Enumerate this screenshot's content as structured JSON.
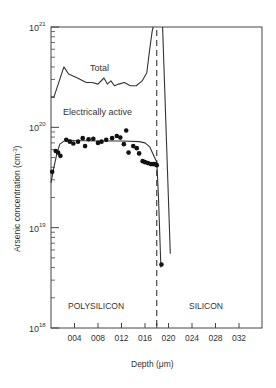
{
  "chart_data": {
    "type": "line",
    "title": "",
    "xlabel": "Depth (μm)",
    "ylabel": "Arsenic concentration (cm⁻³)",
    "xlim": [
      0,
      0.36
    ],
    "ylim": [
      1e+18,
      1e+21
    ],
    "yscale": "log",
    "x_ticks": [
      "004",
      "008",
      "012",
      "016",
      "020",
      "024",
      "028",
      "032"
    ],
    "x_tick_values": [
      0.04,
      0.08,
      0.12,
      0.16,
      0.2,
      0.24,
      0.28,
      0.32
    ],
    "y_ticks": [
      {
        "base": "10",
        "exp": "18",
        "value": 1e+18
      },
      {
        "base": "10",
        "exp": "19",
        "value": 1e+19
      },
      {
        "base": "10",
        "exp": "20",
        "value": 1e+20
      },
      {
        "base": "10",
        "exp": "21",
        "value": 1e+21
      }
    ],
    "grid": false,
    "interface_depth": 0.18,
    "regions": [
      {
        "label": "POLYSILICON",
        "x_center": 0.09
      },
      {
        "label": "SILICON",
        "x_center": 0.265
      }
    ],
    "series": [
      {
        "name": "Total",
        "style": "line",
        "label": "Total",
        "x": [
          0.0,
          0.005,
          0.022,
          0.03,
          0.045,
          0.06,
          0.07,
          0.08,
          0.09,
          0.096,
          0.102,
          0.108,
          0.115,
          0.125,
          0.135,
          0.145,
          0.155,
          0.163,
          0.168,
          0.172,
          0.174
        ],
        "y": [
          2e+20,
          2e+20,
          4e+20,
          3.4e+20,
          3.1e+20,
          2.8e+20,
          2.8e+20,
          2.7e+20,
          3.1e+20,
          2.7e+20,
          2.9e+20,
          2.6e+20,
          2.7e+20,
          2.8e+20,
          2.6e+20,
          2.6e+20,
          2.9e+20,
          3.5e+20,
          6e+20,
          9e+20,
          1e+21
        ]
      },
      {
        "name": "Total (silicon tail)",
        "style": "line",
        "x": [
          0.19,
          0.203
        ],
        "y": [
          1e+21,
          5.5e+18
        ]
      },
      {
        "name": "Electrically active (fit)",
        "style": "line",
        "label": "Electrically active",
        "x": [
          0.0,
          0.005,
          0.01,
          0.015,
          0.025,
          0.04,
          0.08,
          0.12,
          0.15,
          0.16,
          0.168,
          0.175,
          0.18,
          0.183,
          0.187
        ],
        "y": [
          2.8e+19,
          4e+19,
          5.5e+19,
          6.8e+19,
          7.5e+19,
          7.4e+19,
          7.3e+19,
          7.3e+19,
          7.2e+19,
          7e+19,
          6.4e+19,
          5.2e+19,
          4.5e+19,
          2e+19,
          4e+18
        ]
      },
      {
        "name": "Electrically active (measured)",
        "style": "scatter",
        "x": [
          0.002,
          0.008,
          0.012,
          0.016,
          0.026,
          0.032,
          0.038,
          0.046,
          0.054,
          0.058,
          0.064,
          0.072,
          0.08,
          0.086,
          0.094,
          0.104,
          0.112,
          0.118,
          0.124,
          0.128,
          0.132,
          0.14,
          0.146,
          0.15,
          0.156,
          0.16,
          0.165,
          0.17,
          0.174,
          0.177,
          0.18,
          0.188
        ],
        "y": [
          3.6e+19,
          5.8e+19,
          5.6e+19,
          5.2e+19,
          7.5e+19,
          7.2e+19,
          6.9e+19,
          7.2e+19,
          7.8e+19,
          6.5e+19,
          7.6e+19,
          7.7e+19,
          7e+19,
          7.2e+19,
          7.5e+19,
          7.8e+19,
          8.2e+19,
          7.9e+19,
          6.8e+19,
          9.3e+19,
          5.6e+19,
          6.5e+19,
          6.2e+19,
          5.5e+19,
          4.6e+19,
          4.5e+19,
          4.4e+19,
          4.3e+19,
          4.3e+19,
          4.3e+19,
          4.2e+19,
          4.3e+18
        ]
      }
    ],
    "annotations": [
      {
        "text": "Total",
        "x": 0.078,
        "y": 3.7e+20
      },
      {
        "text": "Electrically active",
        "x": 0.075,
        "y": 1.15e+20
      },
      {
        "text": "POLYSILICON",
        "x": 0.09,
        "y": 1.7e+18
      },
      {
        "text": "SILICON",
        "x": 0.265,
        "y": 1.7e+18
      }
    ]
  },
  "labels": {
    "ylabel": "Arsenic concentration (cm",
    "ylabel_sup": "-3",
    "ylabel_end": ")",
    "xlabel": "Depth (μm)",
    "total": "Total",
    "active": "Electrically active",
    "poly": "POLYSILICON",
    "silicon": "SILICON"
  }
}
